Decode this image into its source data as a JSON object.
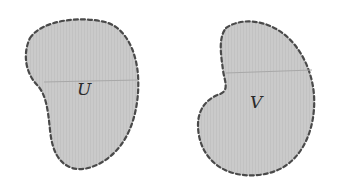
{
  "figure": {
    "background": "#ffffff",
    "fill_color": "#c9c9c9",
    "outline_color": "#4a4a4a",
    "midline_color": "#a8a8a8",
    "regions": [
      {
        "id": "U",
        "label": "U"
      },
      {
        "id": "V",
        "label": "V"
      }
    ]
  }
}
